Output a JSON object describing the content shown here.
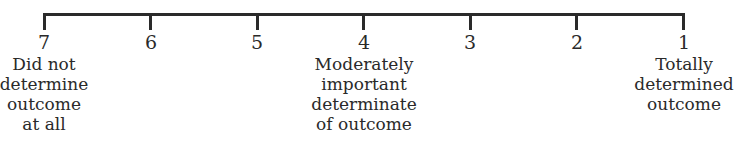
{
  "scale": {
    "clipped_heading_fragment": "",
    "points": [
      {
        "value": "7",
        "x": 44
      },
      {
        "value": "6",
        "x": 151
      },
      {
        "value": "5",
        "x": 257
      },
      {
        "value": "4",
        "x": 364
      },
      {
        "value": "3",
        "x": 470
      },
      {
        "value": "2",
        "x": 577
      },
      {
        "value": "1",
        "x": 684
      }
    ],
    "anchors": [
      {
        "at": "7",
        "x": 44,
        "lines": [
          "Did not",
          "determine",
          "outcome",
          "at all"
        ]
      },
      {
        "at": "4",
        "x": 364,
        "lines": [
          "Moderately",
          "important",
          "determinate",
          "of outcome"
        ]
      },
      {
        "at": "1",
        "x": 684,
        "lines": [
          "Totally",
          "determined",
          "outcome"
        ]
      }
    ]
  },
  "colors": {
    "ink": "#2a2a2a",
    "background": "#ffffff"
  }
}
